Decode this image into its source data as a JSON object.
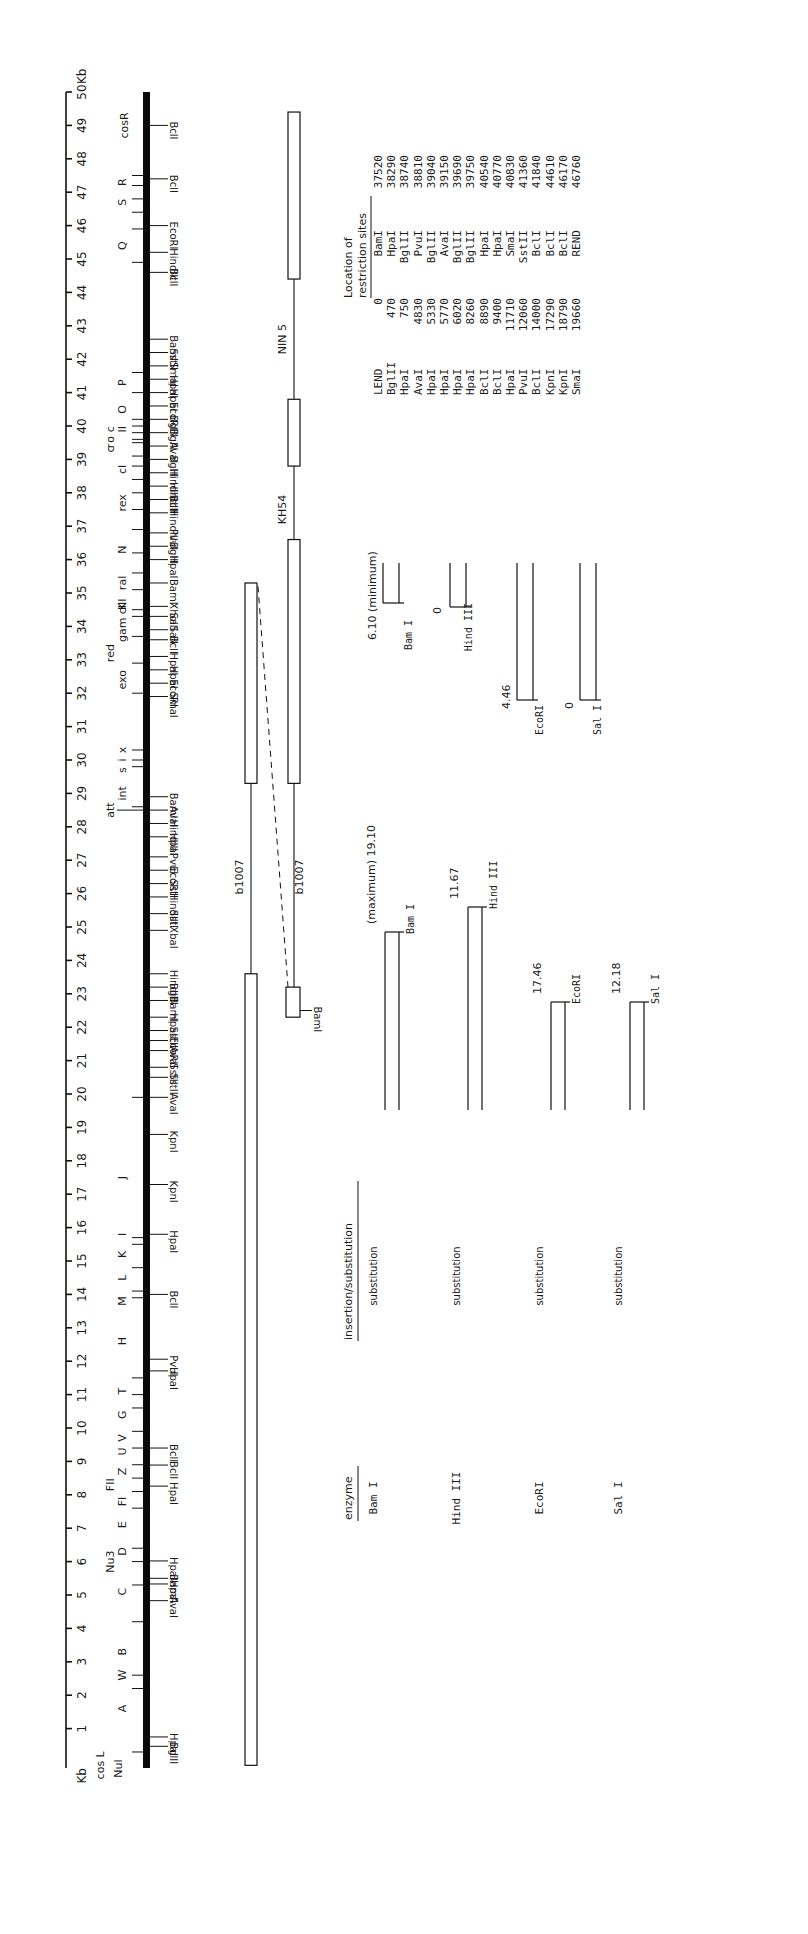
{
  "figure": {
    "axis": {
      "unit_top": "Kb",
      "unit_bottom": "Kb",
      "min": 0,
      "max": 50,
      "ticks": [
        1,
        2,
        3,
        4,
        5,
        6,
        7,
        8,
        9,
        10,
        11,
        12,
        13,
        14,
        15,
        16,
        17,
        18,
        19,
        20,
        21,
        22,
        23,
        24,
        25,
        26,
        27,
        28,
        29,
        30,
        31,
        32,
        33,
        34,
        35,
        36,
        37,
        38,
        39,
        40,
        41,
        42,
        43,
        44,
        45,
        46,
        47,
        48,
        49,
        50
      ]
    },
    "cos_labels": {
      "right": "cosR",
      "left": "cos L",
      "nul": "Nul"
    },
    "genes": [
      {
        "label": "A",
        "kb": 1.6
      },
      {
        "label": "W",
        "kb": 2.6
      },
      {
        "label": "B",
        "kb": 3.3
      },
      {
        "label": "C",
        "kb": 5.1
      },
      {
        "label": "Nu3",
        "kb": 6.0
      },
      {
        "label": "D",
        "kb": 6.3
      },
      {
        "label": "E",
        "kb": 7.1
      },
      {
        "label": "FI",
        "kb": 7.8
      },
      {
        "label": "FII",
        "kb": 8.3
      },
      {
        "label": "Z",
        "kb": 8.7
      },
      {
        "label": "U",
        "kb": 9.3
      },
      {
        "label": "V",
        "kb": 9.7
      },
      {
        "label": "G",
        "kb": 10.4
      },
      {
        "label": "T",
        "kb": 11.1
      },
      {
        "label": "H",
        "kb": 12.6
      },
      {
        "label": "M",
        "kb": 13.8
      },
      {
        "label": "L",
        "kb": 14.5
      },
      {
        "label": "K",
        "kb": 15.2
      },
      {
        "label": "I",
        "kb": 15.8
      },
      {
        "label": "J",
        "kb": 17.5
      },
      {
        "label": "att",
        "kb": 28.5
      },
      {
        "label": "int",
        "kb": 29.0
      },
      {
        "label": "x",
        "kb": 30.3
      },
      {
        "label": "i",
        "kb": 30.0
      },
      {
        "label": "s",
        "kb": 29.7
      },
      {
        "label": "exo",
        "kb": 32.4
      },
      {
        "label": "red",
        "kb": 33.2
      },
      {
        "label": "gam",
        "kb": 33.9
      },
      {
        "label": "K",
        "kb": 34.6
      },
      {
        "label": "cIII",
        "kb": 34.6
      },
      {
        "label": "ral",
        "kb": 35.3
      },
      {
        "label": "N",
        "kb": 36.3
      },
      {
        "label": "rex",
        "kb": 37.7
      },
      {
        "label": "cI",
        "kb": 38.7
      },
      {
        "label": "c",
        "kb": 39.3
      },
      {
        "label": "r",
        "kb": 39.4
      },
      {
        "label": "o",
        "kb": 39.6
      },
      {
        "label": "c",
        "kb": 39.9
      },
      {
        "label": "II",
        "kb": 39.9
      },
      {
        "label": "O",
        "kb": 40.5
      },
      {
        "label": "P",
        "kb": 41.3
      },
      {
        "label": "Q",
        "kb": 45.4
      },
      {
        "label": "S",
        "kb": 46.7
      },
      {
        "label": "R",
        "kb": 47.3
      }
    ],
    "gene_ticks": [
      0.3,
      2.2,
      2.6,
      4.2,
      5.3,
      6.0,
      6.4,
      7.6,
      8.1,
      8.5,
      8.9,
      9.4,
      9.9,
      10.6,
      11.0,
      11.5,
      13.9,
      14.1,
      14.8,
      15.5,
      15.7,
      19.9,
      28.6,
      29.8,
      30.0,
      30.3,
      32.0,
      32.9,
      33.7,
      34.3,
      34.5,
      35.1,
      35.6,
      36.2,
      36.9,
      37.5,
      38.0,
      38.4,
      38.8,
      39.1,
      39.5,
      39.6,
      39.8,
      40.0,
      40.2,
      41.0,
      41.6,
      44.9,
      45.9,
      46.4,
      46.8,
      47.2,
      47.5
    ],
    "restriction_sites_on_map": [
      {
        "label": "BglII",
        "kb": 0.47
      },
      {
        "label": "HpaI",
        "kb": 0.75
      },
      {
        "label": "AvaI",
        "kb": 4.83
      },
      {
        "label": "HpaI",
        "kb": 5.33
      },
      {
        "label": "BamI",
        "kb": 5.5
      },
      {
        "label": "HpaI",
        "kb": 6.02
      },
      {
        "label": "HpaI",
        "kb": 8.26
      },
      {
        "label": "BclI",
        "kb": 8.89
      },
      {
        "label": "BclI",
        "kb": 9.4
      },
      {
        "label": "HpaI",
        "kb": 11.71
      },
      {
        "label": "PvuI",
        "kb": 12.06
      },
      {
        "label": "BclI",
        "kb": 14.0
      },
      {
        "label": "HpaI",
        "kb": 15.8
      },
      {
        "label": "KpnI",
        "kb": 17.29
      },
      {
        "label": "KpnI",
        "kb": 18.79
      },
      {
        "label": "AvaI",
        "kb": 19.9
      },
      {
        "label": "SstII",
        "kb": 20.5
      },
      {
        "label": "SstII",
        "kb": 20.8
      },
      {
        "label": "AvaI",
        "kb": 21.3
      },
      {
        "label": "EcoRI",
        "kb": 21.6
      },
      {
        "label": "SstII",
        "kb": 21.9
      },
      {
        "label": "HpaI",
        "kb": 22.3
      },
      {
        "label": "BamI",
        "kb": 22.8
      },
      {
        "label": "BglII",
        "kb": 23.2
      },
      {
        "label": "HindIII",
        "kb": 23.6
      },
      {
        "label": "XbaI",
        "kb": 24.9
      },
      {
        "label": "SstI",
        "kb": 25.4
      },
      {
        "label": "HindIII",
        "kb": 25.9
      },
      {
        "label": "SstI",
        "kb": 26.3
      },
      {
        "label": "EcoRI",
        "kb": 26.7
      },
      {
        "label": "PvuI",
        "kb": 27.1
      },
      {
        "label": "HpaI",
        "kb": 27.7
      },
      {
        "label": "HindIII",
        "kb": 28.1
      },
      {
        "label": "AvaI",
        "kb": 28.5
      },
      {
        "label": "BamI",
        "kb": 28.9
      },
      {
        "label": "SmaI",
        "kb": 31.9
      },
      {
        "label": "EcoRI",
        "kb": 32.3
      },
      {
        "label": "HpaI",
        "kb": 32.7
      },
      {
        "label": "HpaI",
        "kb": 33.1
      },
      {
        "label": "BclI",
        "kb": 33.6
      },
      {
        "label": "SalI",
        "kb": 33.9
      },
      {
        "label": "SalI",
        "kb": 34.3
      },
      {
        "label": "XhoI",
        "kb": 34.6
      },
      {
        "label": "BamI",
        "kb": 35.3
      },
      {
        "label": "HpaI",
        "kb": 36.0
      },
      {
        "label": "BglII",
        "kb": 36.4
      },
      {
        "label": "PvuI",
        "kb": 36.8
      },
      {
        "label": "HindIII",
        "kb": 37.4
      },
      {
        "label": "BclI",
        "kb": 37.8
      },
      {
        "label": "HindIII",
        "kb": 38.2
      },
      {
        "label": "HindIII",
        "kb": 38.6
      },
      {
        "label": "BglII",
        "kb": 39.0
      },
      {
        "label": "AvaI",
        "kb": 39.4
      },
      {
        "label": "BglII",
        "kb": 39.8
      },
      {
        "label": "BglII",
        "kb": 40.2
      },
      {
        "label": "EcoRI",
        "kb": 40.6
      },
      {
        "label": "HpaI",
        "kb": 41.0
      },
      {
        "label": "HpaI",
        "kb": 41.4
      },
      {
        "label": "SmaI",
        "kb": 41.8
      },
      {
        "label": "SstII",
        "kb": 42.2
      },
      {
        "label": "BamI",
        "kb": 42.6
      },
      {
        "label": "BclI",
        "kb": 44.6
      },
      {
        "label": "HindIII",
        "kb": 45.2
      },
      {
        "label": "EcoRI",
        "kb": 46.0
      },
      {
        "label": "BclI",
        "kb": 47.4
      },
      {
        "label": "BclI",
        "kb": 49.0
      }
    ],
    "deletions": [
      {
        "label": "b1007",
        "segments": [
          [
            0,
            23.6
          ],
          [
            29.3,
            35.3
          ]
        ],
        "gap": [
          23.6,
          29.3
        ]
      },
      {
        "label": "KH54",
        "segments": [
          [
            29.3,
            36.6
          ],
          [
            38.8,
            40.8
          ]
        ],
        "gap": [
          36.6,
          38.8
        ]
      },
      {
        "label": "NIN 5",
        "segments": [
          [
            44.4,
            49.4
          ]
        ],
        "gap": [
          40.8,
          44.4
        ]
      },
      {
        "label": "b1007",
        "box": [
          22.3,
          23.2
        ],
        "box_label": "BamI"
      }
    ],
    "table": {
      "title_line1": "Location of",
      "title_line2": "restriction sites",
      "rows": [
        [
          "LEND",
          "0",
          "BamI",
          "37520"
        ],
        [
          "BglII",
          "470",
          "HpaI",
          "38290"
        ],
        [
          "HpaI",
          "750",
          "BglII",
          "38740"
        ],
        [
          "AvaI",
          "4830",
          "PvuI",
          "38810"
        ],
        [
          "HpaI",
          "5330",
          "BglII",
          "39040"
        ],
        [
          "HpaI",
          "5770",
          "AvaI",
          "39150"
        ],
        [
          "HpaI",
          "6020",
          "BglII",
          "39690"
        ],
        [
          "HpaI",
          "8260",
          "BglII",
          "39750"
        ],
        [
          "BclI",
          "8890",
          "HpaI",
          "40540"
        ],
        [
          "BclI",
          "9400",
          "HpaI",
          "40770"
        ],
        [
          "HpaI",
          "11710",
          "SmaI",
          "40830"
        ],
        [
          "PvuI",
          "12060",
          "SstII",
          "41360"
        ],
        [
          "BclI",
          "14000",
          "BclI",
          "41840"
        ],
        [
          "KpnI",
          "17290",
          "BclI",
          "44610"
        ],
        [
          "KpnI",
          "18790",
          "BclI",
          "46170"
        ],
        [
          "SmaI",
          "19660",
          "REND",
          "46760"
        ]
      ]
    },
    "replacement_table": {
      "header_enzyme": "enzyme",
      "header_type": "insertion/substitution",
      "rows": [
        {
          "enzyme": "Bam I",
          "type": "substitution",
          "max_label": "(maximum) 19.10",
          "max_site": "Bam I",
          "min_label": "6.10 (minimum)",
          "min_site": "Bam I"
        },
        {
          "enzyme": "Hind III",
          "type": "substitution",
          "max_label": "11.67",
          "max_site": "Hind III",
          "min_label": "0",
          "min_site": "Hind III"
        },
        {
          "enzyme": "EcoRI",
          "type": "substitution",
          "max_label": "17.46",
          "max_site": "EcoRI",
          "min_label": "4.46",
          "min_site": "EcoRI"
        },
        {
          "enzyme": "Sal I",
          "type": "substitution",
          "max_label": "12.18",
          "max_site": "Sal I",
          "min_label": "0",
          "min_site": "Sal I"
        }
      ]
    }
  }
}
